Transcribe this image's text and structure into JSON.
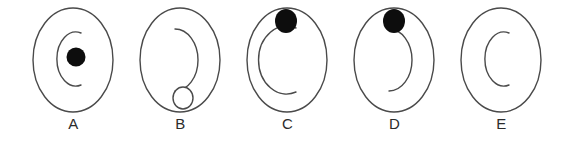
{
  "figure": {
    "width": 569,
    "height": 144,
    "background_color": "#ffffff",
    "stroke_color": "#4a4a4a",
    "fill_color": "#0d0d0d",
    "panel_count": 5
  },
  "panels": [
    {
      "id": "panel-a",
      "label": "A",
      "center_x": 73,
      "outer_shape": "oval",
      "arc": {
        "type": "c-arc-open-right",
        "size": "small",
        "cx": 62,
        "cy": 58,
        "rx": 18,
        "ry": 26
      },
      "marker": {
        "type": "filled-dot",
        "present": true,
        "cx": 76,
        "cy": 57,
        "rx": 9,
        "ry": 9,
        "fill": "#0d0d0d"
      }
    },
    {
      "id": "panel-b",
      "label": "B",
      "center_x": 180,
      "outer_shape": "oval",
      "arc": {
        "type": "reverse-c-hook-open-left",
        "size": "large",
        "cx": 188,
        "cy": 58,
        "rx": 22,
        "ry": 31
      },
      "marker": {
        "type": "hollow-circle",
        "present": true,
        "cx": 183,
        "cy": 98,
        "rx": 10,
        "ry": 11,
        "fill": "#ffffff"
      }
    },
    {
      "id": "panel-c",
      "label": "C",
      "center_x": 287,
      "outer_shape": "oval",
      "arc": {
        "type": "c-arc-open-right",
        "size": "large",
        "cx": 288,
        "cy": 60,
        "rx": 27,
        "ry": 34
      },
      "marker": {
        "type": "filled-dot",
        "present": true,
        "cx": 286,
        "cy": 21,
        "rx": 11,
        "ry": 12,
        "fill": "#0d0d0d"
      }
    },
    {
      "id": "panel-d",
      "label": "D",
      "center_x": 394,
      "outer_shape": "oval",
      "arc": {
        "type": "reverse-c-hook-open-left",
        "size": "large",
        "cx": 400,
        "cy": 58,
        "rx": 22,
        "ry": 31
      },
      "marker": {
        "type": "filled-dot",
        "present": true,
        "cx": 394,
        "cy": 21,
        "rx": 11,
        "ry": 12,
        "fill": "#0d0d0d"
      }
    },
    {
      "id": "panel-e",
      "label": "E",
      "center_x": 501,
      "outer_shape": "oval",
      "arc": {
        "type": "c-arc-open-right",
        "size": "small",
        "cx": 492,
        "cy": 58,
        "rx": 18,
        "ry": 26
      },
      "marker": {
        "type": "none",
        "present": false
      }
    }
  ]
}
